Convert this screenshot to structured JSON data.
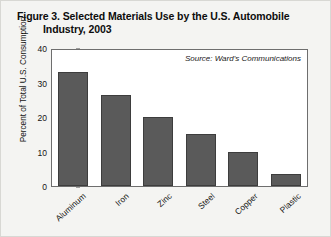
{
  "figure": {
    "title_line1": "Figure 3. Selected Materials Use by the U.S. Automobile",
    "title_line2": "Industry, 2003",
    "source_note": "Source: Ward's Communications"
  },
  "chart_data": {
    "type": "bar",
    "title": "Figure 3. Selected Materials Use by the U.S. Automobile Industry, 2003",
    "categories": [
      "Aluminum",
      "Iron",
      "Zinc",
      "Steel",
      "Copper",
      "Plastic"
    ],
    "values": [
      33,
      26.5,
      20,
      15,
      10,
      3.5
    ],
    "xlabel": "",
    "ylabel": "Percent of Total U.S. Consumption",
    "ylim": [
      0,
      40
    ],
    "yticks": [
      0,
      10,
      20,
      30,
      40
    ],
    "ytick_labels": [
      "0",
      "10",
      "20",
      "30",
      "40"
    ],
    "grid": false,
    "legend": false,
    "annotations": [
      "Source: Ward's Communications"
    ],
    "bar_color": "#5a5a5a",
    "plot_background": "#ffffff",
    "figure_background": "#f4f4f2"
  }
}
